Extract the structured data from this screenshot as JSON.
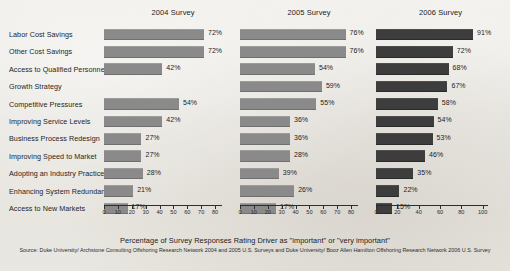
{
  "figure": {
    "axis_title": "Percentage of Survey Responses Rating Driver as \"important\" or \"very important\"",
    "source": "Source: Duke University/ Archstone Consulting Offshoring Research Network 2004 and 2005 U.S. Surveys and Duke University/ Booz Allen Hamilton Offshoring Research Network 2006 U.S. Survey",
    "bar_color_light": "#8a8a8a",
    "bar_color_dark": "#3d3d3d",
    "background": "#e8e6e1"
  },
  "chart_data": {
    "type": "bar",
    "title": "",
    "xlabel": "Percentage of Survey Responses Rating Driver as \"important\" or \"very important\"",
    "ylabel": "",
    "orientation": "horizontal",
    "grid": false,
    "legend": "none",
    "categories": [
      "Labor Cost Savings",
      "Other Cost Savings",
      "Access to Qualified Personnel",
      "Growth Strategy",
      "Competitive Pressures",
      "Improving Service Levels",
      "Business Process Redesign",
      "Improving Speed to Market",
      "Adopting an Industry Practice",
      "Enhancing System Redundancy",
      "Access to New Markets"
    ],
    "panels": [
      {
        "name": "2004 Survey",
        "xlim": [
          0,
          85
        ],
        "ticks": [
          0,
          10,
          20,
          30,
          40,
          50,
          60,
          70,
          80
        ],
        "color": "#8a8a8a",
        "values": [
          72,
          72,
          42,
          0,
          54,
          42,
          27,
          27,
          28,
          21,
          17
        ],
        "labels": [
          "72%",
          "72%",
          "42%",
          "",
          "54%",
          "42%",
          "27%",
          "27%",
          "28%",
          "21%",
          "17%"
        ]
      },
      {
        "name": "2005 Survey",
        "xlim": [
          0,
          85
        ],
        "ticks": [
          0,
          10,
          20,
          30,
          40,
          50,
          60,
          70,
          80
        ],
        "color": "#8a8a8a",
        "values": [
          76,
          76,
          54,
          59,
          55,
          36,
          36,
          36,
          28,
          39,
          26,
          17
        ],
        "labels": [
          "76%",
          "76%",
          "54%",
          "59%",
          "55%",
          "36%",
          "36%",
          "28%",
          "39%",
          "26%",
          "17%"
        ]
      },
      {
        "name": "2006 Survey",
        "xlim": [
          0,
          105
        ],
        "ticks": [
          0,
          20,
          40,
          60,
          80,
          100
        ],
        "color": "#3d3d3d",
        "values": [
          91,
          72,
          68,
          67,
          58,
          54,
          53,
          46,
          35,
          22,
          15
        ],
        "labels": [
          "91%",
          "72%",
          "68%",
          "67%",
          "58%",
          "54%",
          "53%",
          "46%",
          "35%",
          "22%",
          "15%"
        ]
      }
    ]
  }
}
